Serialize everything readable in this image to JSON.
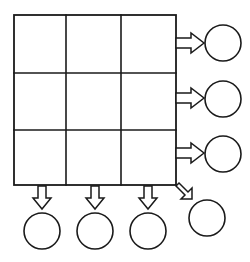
{
  "diagram": {
    "background_color": "#ffffff",
    "stroke_color": "#1a1a1a",
    "fill_color": "#ffffff",
    "grid": {
      "name": "3x3-grid",
      "rows": 3,
      "columns": 3,
      "x": 14,
      "y": 15,
      "width": 162,
      "height": 170,
      "column_edges": [
        14,
        66,
        121,
        176
      ],
      "row_edges": [
        15,
        73,
        130,
        185
      ],
      "cells": [
        {
          "row": 1,
          "col": 1,
          "label": ""
        },
        {
          "row": 1,
          "col": 2,
          "label": ""
        },
        {
          "row": 1,
          "col": 3,
          "label": ""
        },
        {
          "row": 2,
          "col": 1,
          "label": ""
        },
        {
          "row": 2,
          "col": 2,
          "label": ""
        },
        {
          "row": 2,
          "col": 3,
          "label": ""
        },
        {
          "row": 3,
          "col": 1,
          "label": ""
        },
        {
          "row": 3,
          "col": 2,
          "label": ""
        },
        {
          "row": 3,
          "col": 3,
          "label": ""
        }
      ]
    },
    "right_arrows": [
      {
        "name": "row-1-arrow",
        "direction": "right",
        "x": 176,
        "y": 34,
        "length": 28,
        "label": ""
      },
      {
        "name": "row-2-arrow",
        "direction": "right",
        "x": 176,
        "y": 89,
        "length": 28,
        "label": ""
      },
      {
        "name": "row-3-arrow",
        "direction": "right",
        "x": 176,
        "y": 144,
        "length": 28,
        "label": ""
      }
    ],
    "bottom_arrows": [
      {
        "name": "column-1-arrow",
        "direction": "down",
        "x": 42,
        "y": 186,
        "length": 24,
        "label": ""
      },
      {
        "name": "column-2-arrow",
        "direction": "down",
        "x": 95,
        "y": 186,
        "length": 24,
        "label": ""
      },
      {
        "name": "column-3-arrow",
        "direction": "down",
        "x": 148,
        "y": 186,
        "length": 24,
        "label": ""
      }
    ],
    "diagonal_arrow": {
      "name": "corner-diagonal-arrow",
      "direction": "down-right",
      "from_x": 176,
      "from_y": 182,
      "to_x": 199,
      "to_y": 205,
      "label": ""
    },
    "right_circles": [
      {
        "name": "row-1-result-circle",
        "cx": 223,
        "cy": 43,
        "r": 18,
        "label": ""
      },
      {
        "name": "row-2-result-circle",
        "cx": 223,
        "cy": 99,
        "r": 18,
        "label": ""
      },
      {
        "name": "row-3-result-circle",
        "cx": 223,
        "cy": 154,
        "r": 18,
        "label": ""
      }
    ],
    "bottom_circles": [
      {
        "name": "column-1-result-circle",
        "cx": 42,
        "cy": 231,
        "r": 18,
        "label": ""
      },
      {
        "name": "column-2-result-circle",
        "cx": 95,
        "cy": 231,
        "r": 18,
        "label": ""
      },
      {
        "name": "column-3-result-circle",
        "cx": 148,
        "cy": 231,
        "r": 18,
        "label": ""
      },
      {
        "name": "diagonal-result-circle",
        "cx": 207,
        "cy": 218,
        "r": 18,
        "label": ""
      }
    ]
  }
}
